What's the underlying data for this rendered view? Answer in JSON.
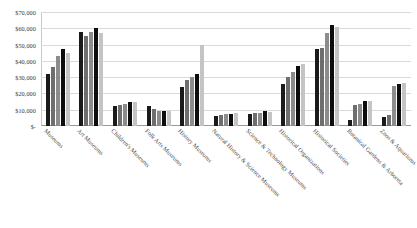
{
  "chart_data": {
    "type": "bar",
    "title": "",
    "xlabel": "",
    "ylabel": "",
    "ylim": [
      0,
      70000
    ],
    "grid": true,
    "legend": "none",
    "y_ticks": [
      "$-",
      "$10,000",
      "$20,000",
      "$30,000",
      "$40,000",
      "$50,000",
      "$60,000",
      "$70,000"
    ],
    "y_tick_values": [
      0,
      10000,
      20000,
      30000,
      40000,
      50000,
      60000,
      70000
    ],
    "categories": [
      "Museums",
      "Art Museums",
      "Children's Museums",
      "Folk Arts Museums",
      "History Museums",
      "Natural History & Science Museums",
      "Science & Technology Museums",
      "Historical Organizations",
      "Historical Societies",
      "Botanical Gardens & Arboreta",
      "Zoos & Aquariums"
    ],
    "series": [
      {
        "name": "Series 1",
        "color": "#1a1a1a",
        "values": [
          32000,
          58000,
          12000,
          12500,
          24000,
          6000,
          7500,
          26000,
          47000,
          4000,
          5500
        ]
      },
      {
        "name": "Series 2",
        "color": "#6e6e6e",
        "values": [
          36000,
          55000,
          13000,
          10500,
          28500,
          6500,
          8000,
          30000,
          48000,
          13000,
          6500
        ]
      },
      {
        "name": "Series 3",
        "color": "#8c8c8c",
        "values": [
          43000,
          58000,
          13500,
          9500,
          30000,
          7500,
          8000,
          33000,
          57000,
          13500,
          24500
        ]
      },
      {
        "name": "Series 4",
        "color": "#0d0d0d",
        "values": [
          47000,
          60000,
          15000,
          9500,
          32000,
          7500,
          9000,
          37000,
          62000,
          15500,
          26000
        ]
      },
      {
        "name": "Series 5",
        "color": "#c4c4c4",
        "values": [
          45000,
          57000,
          14500,
          9000,
          50000,
          8000,
          8500,
          38000,
          61000,
          15500,
          26500
        ]
      }
    ]
  }
}
